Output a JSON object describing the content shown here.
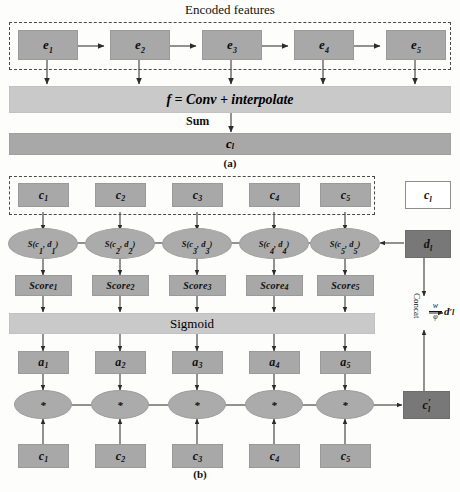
{
  "figure": {
    "panel_a": {
      "caption": "(a)",
      "title": "Encoded features",
      "encoded_nodes": [
        {
          "label": "e",
          "sub": "1"
        },
        {
          "label": "e",
          "sub": "2"
        },
        {
          "label": "e",
          "sub": "3"
        },
        {
          "label": "e",
          "sub": "4"
        },
        {
          "label": "e",
          "sub": "5"
        }
      ],
      "conv_bar": "f = Conv + interpolate",
      "sum_label": "Sum",
      "output_bar": {
        "label": "c",
        "sub": "l"
      }
    },
    "panel_b": {
      "caption": "(b)",
      "context_nodes": [
        {
          "label": "c",
          "sub": "1"
        },
        {
          "label": "c",
          "sub": "2"
        },
        {
          "label": "c",
          "sub": "3"
        },
        {
          "label": "c",
          "sub": "4"
        },
        {
          "label": "c",
          "sub": "5"
        }
      ],
      "legend_node": {
        "label": "c",
        "sub": "l"
      },
      "query_node": {
        "label": "d",
        "sub": "l"
      },
      "similarity_nodes": [
        {
          "fn": "S",
          "arg1": "c",
          "arg1sub": "1",
          "arg2": "d",
          "arg2sub": "1"
        },
        {
          "fn": "S",
          "arg1": "c",
          "arg1sub": "2",
          "arg2": "d",
          "arg2sub": "2"
        },
        {
          "fn": "S",
          "arg1": "c",
          "arg1sub": "3",
          "arg2": "d",
          "arg2sub": "3"
        },
        {
          "fn": "S",
          "arg1": "c",
          "arg1sub": "4",
          "arg2": "d",
          "arg2sub": "4"
        },
        {
          "fn": "S",
          "arg1": "c",
          "arg1sub": "5",
          "arg2": "d",
          "arg2sub": "5"
        }
      ],
      "score_nodes": [
        {
          "label": "Score",
          "sub": "1"
        },
        {
          "label": "Score",
          "sub": "2"
        },
        {
          "label": "Score",
          "sub": "3"
        },
        {
          "label": "Score",
          "sub": "4"
        },
        {
          "label": "Score",
          "sub": "5"
        }
      ],
      "sigmoid_bar": "Sigmoid",
      "attention_nodes": [
        {
          "label": "a",
          "sub": "1"
        },
        {
          "label": "a",
          "sub": "2"
        },
        {
          "label": "a",
          "sub": "3"
        },
        {
          "label": "a",
          "sub": "4"
        },
        {
          "label": "a",
          "sub": "5"
        }
      ],
      "multiply_nodes": [
        "*",
        "*",
        "*",
        "*",
        "*"
      ],
      "bottom_context_nodes": [
        {
          "label": "c",
          "sub": "1"
        },
        {
          "label": "c",
          "sub": "2"
        },
        {
          "label": "c",
          "sub": "3"
        },
        {
          "label": "c",
          "sub": "4"
        },
        {
          "label": "c",
          "sub": "5"
        }
      ],
      "concat_label": "Concat",
      "transform": {
        "numerator": "w",
        "denominator": "φ"
      },
      "refined_query": {
        "label": "d",
        "prime": "′",
        "sub": "l"
      },
      "refined_context": {
        "label": "c",
        "prime": "′",
        "sub": "l"
      }
    }
  },
  "colors": {
    "node_mid": "#a8a8a8",
    "node_light": "#c9c9c9",
    "node_dark": "#787878",
    "stroke": "#555555",
    "dash": "#4a4a4a"
  }
}
